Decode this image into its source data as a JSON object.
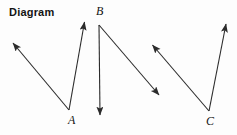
{
  "page": {
    "title": "Diagram",
    "background_color": "#fdfdfd",
    "width": 237,
    "height": 135
  },
  "figure": {
    "title": "Diagram",
    "stroke_color": "#2b2b2b",
    "stroke_width": 1.1,
    "labels": [
      {
        "id": "A",
        "text": "A",
        "x": 68,
        "y": 114
      },
      {
        "id": "B",
        "text": "B",
        "x": 96,
        "y": 5
      },
      {
        "id": "C",
        "text": "C",
        "x": 206,
        "y": 115
      }
    ],
    "angles": [
      {
        "name": "angle-A",
        "vertex": {
          "x": 69,
          "y": 110
        },
        "rays": [
          {
            "name": "ray-A-upper-left",
            "tip": {
              "x": 11,
              "y": 41
            }
          },
          {
            "name": "ray-A-upper-right",
            "tip": {
              "x": 85,
              "y": 19
            }
          }
        ]
      },
      {
        "name": "angle-B",
        "vertex": {
          "x": 99,
          "y": 25
        },
        "rays": [
          {
            "name": "ray-B-down",
            "tip": {
              "x": 100,
              "y": 119
            }
          },
          {
            "name": "ray-B-down-right",
            "tip": {
              "x": 162,
              "y": 98
            }
          }
        ]
      },
      {
        "name": "angle-C",
        "vertex": {
          "x": 209,
          "y": 111
        },
        "rays": [
          {
            "name": "ray-C-upper-left",
            "tip": {
              "x": 150,
              "y": 42
            }
          },
          {
            "name": "ray-C-upper-right",
            "tip": {
              "x": 227,
              "y": 20
            }
          }
        ]
      }
    ]
  }
}
